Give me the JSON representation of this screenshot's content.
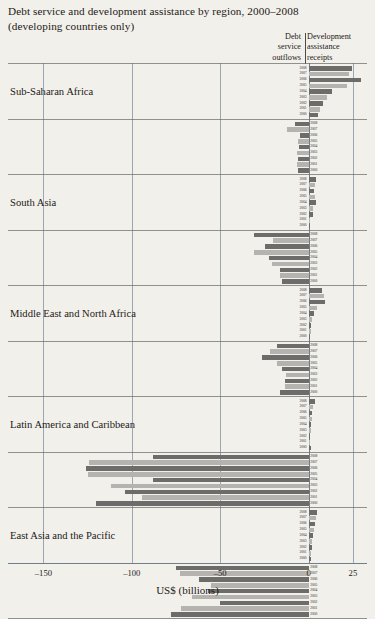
{
  "title": {
    "line1": "Debt service and development assistance by region, 2000–2008",
    "line2": "(developing countries only)"
  },
  "column_headers": {
    "left": "Debt\nservice\noutflows",
    "left_lines": [
      "Debt",
      "service",
      "outflows"
    ],
    "right": "Development\nassistance\nreceipts",
    "right_lines": [
      "Development",
      "assistance",
      "receipts"
    ]
  },
  "axis": {
    "title": "US$ (billions)",
    "ticks": [
      -150,
      -100,
      -50,
      0,
      25
    ],
    "tick_labels": [
      "–150",
      "–100",
      "–50",
      "0",
      "25"
    ],
    "xlim": [
      -170,
      33
    ]
  },
  "colors": {
    "bar_dark": "#6d6c6a",
    "bar_light": "#b4b3b0",
    "grid": "#9aa6b4",
    "rule": "#6b6b68",
    "background": "#f2f0eb",
    "text": "#1d1a17"
  },
  "chart_data": {
    "type": "bar",
    "title": "Debt service and development assistance by region, 2000–2008 (developing countries only)",
    "xlabel": "US$ (billions)",
    "ylabel": "",
    "orientation": "horizontal",
    "grid": true,
    "legend_position": "column-headers",
    "xlim": [
      -170,
      33
    ],
    "xticks": [
      -150,
      -100,
      -50,
      0,
      25
    ],
    "years": [
      2008,
      2007,
      2006,
      2005,
      2004,
      2003,
      2002,
      2001,
      2000
    ],
    "series": [
      {
        "name": "Debt service outflows",
        "sign": "negative",
        "panel": "left"
      },
      {
        "name": "Development assistance receipts",
        "sign": "positive",
        "panel": "right"
      }
    ],
    "regions": [
      {
        "name": "Sub-Saharan Africa",
        "development_assistance_receipts": [
          24.5,
          23.0,
          29.5,
          22.0,
          13.5,
          10.5,
          8.0,
          6.5,
          5.5
        ],
        "debt_service_outflows": [
          -7.5,
          -12.5,
          -5.0,
          -6.0,
          -5.5,
          -6.5,
          -6.0,
          -6.5,
          -6.0
        ]
      },
      {
        "name": "South Asia",
        "development_assistance_receipts": [
          4.0,
          3.5,
          3.0,
          3.5,
          4.0,
          2.5,
          2.5,
          1.0,
          0.8
        ],
        "debt_service_outflows": [
          -31.0,
          -20.0,
          -24.5,
          -31.0,
          -22.5,
          -21.0,
          -16.0,
          -16.0,
          -15.0
        ]
      },
      {
        "name": "Middle East and North Africa",
        "development_assistance_receipts": [
          7.5,
          9.0,
          9.5,
          5.0,
          3.0,
          2.0,
          1.5,
          1.2,
          1.0
        ],
        "debt_service_outflows": [
          -18.0,
          -22.0,
          -26.5,
          -18.0,
          -15.0,
          -13.0,
          -13.5,
          -13.5,
          -16.0
        ]
      },
      {
        "name": "Latin America and Caribbean",
        "development_assistance_receipts": [
          3.5,
          2.5,
          2.0,
          2.0,
          1.5,
          1.2,
          1.0,
          0.8,
          1.5
        ],
        "debt_service_outflows": [
          -88.0,
          -124.0,
          -126.0,
          -125.0,
          -88.0,
          -112.0,
          -104.0,
          -94.0,
          -120.0
        ]
      },
      {
        "name": "East Asia and the Pacific",
        "development_assistance_receipts": [
          5.0,
          4.0,
          3.5,
          3.0,
          2.5,
          2.0,
          1.8,
          1.5,
          1.5
        ],
        "debt_service_outflows": [
          -75.0,
          -73.0,
          -62.0,
          -55.0,
          -57.0,
          -66.0,
          -50.0,
          -72.0,
          -78.0
        ]
      }
    ]
  }
}
